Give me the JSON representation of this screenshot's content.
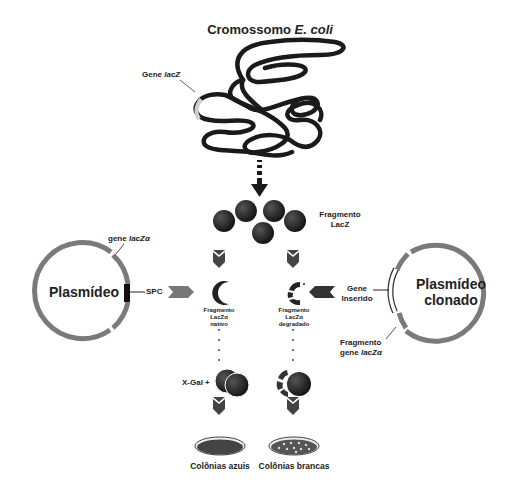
{
  "title": {
    "prefix": "Cromossomo",
    "species": "E. coli"
  },
  "chromosome": {
    "gene_label_prefix": "Gene",
    "gene_label_italic": "lacZ"
  },
  "fragment_label": {
    "line1": "Fragmento",
    "line2": "LacZ"
  },
  "left_plasmid": {
    "name": "Plasmídeo",
    "gene_label_prefix": "gene",
    "gene_label_italic": "lacZα",
    "site_label": "SPC"
  },
  "right_plasmid": {
    "name_line1": "Plasmídeo",
    "name_line2": "clonado",
    "insert_label_line1": "Gene",
    "insert_label_line2": "Inserido",
    "fragment_label_line1": "Fragmento",
    "fragment_label_prefix": "gene",
    "fragment_label_italic": "lacZα"
  },
  "native_fragment": {
    "line1": "Fragmento",
    "line2": "LacZα",
    "line3": "nativo"
  },
  "degraded_fragment": {
    "line1": "Fragmento",
    "line2": "LacZα",
    "line3": "degradado"
  },
  "xgal_label": "X-Gal +",
  "outcomes": {
    "left": "Colônias azuis",
    "right": "Colônias brancas"
  },
  "colors": {
    "dark": "#1a1a1a",
    "ring": "#7a7a7a",
    "plate": "#555555",
    "light": "#d0d0d0"
  }
}
